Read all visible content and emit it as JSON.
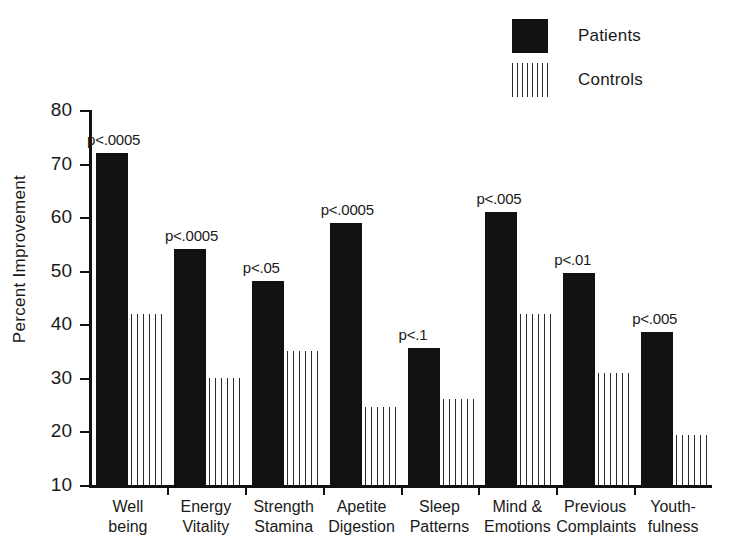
{
  "legend": {
    "items": [
      {
        "label": "Patients",
        "swatch": "solid-black-square",
        "color": "#111111"
      },
      {
        "label": "Controls",
        "swatch": "vertical-hatch-bars",
        "color": "#2b2b2b"
      }
    ]
  },
  "axes": {
    "ylabel": "Percent Improvement",
    "yticks": [
      "10",
      "20",
      "30",
      "40",
      "50",
      "60",
      "70",
      "80"
    ],
    "ymin": 10,
    "ymax": 80
  },
  "chart_data": {
    "type": "bar",
    "title": "",
    "xlabel": "",
    "ylabel": "Percent Improvement",
    "ylim": [
      10,
      80
    ],
    "grid": false,
    "legend_position": "top-right",
    "categories": [
      "Well being",
      "Energy Vitality",
      "Strength Stamina",
      "Apetite Digestion",
      "Sleep Patterns",
      "Mind & Emotions",
      "Previous Complaints",
      "Youth-fulness"
    ],
    "category_lines": [
      [
        "Well",
        "being"
      ],
      [
        "Energy",
        "Vitality"
      ],
      [
        "Strength",
        "Stamina"
      ],
      [
        "Apetite",
        "Digestion"
      ],
      [
        "Sleep",
        "Patterns"
      ],
      [
        "Mind &",
        "Emotions"
      ],
      [
        "Previous",
        "Complaints"
      ],
      [
        "Youth-",
        "fulness"
      ]
    ],
    "series": [
      {
        "name": "Patients",
        "values": [
          72,
          54,
          48,
          59,
          35.5,
          61,
          49.5,
          38.5
        ]
      },
      {
        "name": "Controls",
        "values": [
          42,
          30,
          35,
          24.5,
          26,
          42,
          31,
          19.3
        ]
      }
    ],
    "annotations": [
      "p<.0005",
      "p<.0005",
      "p<.05",
      "p<.0005",
      "p<.1",
      "p<.005",
      "p<.01",
      "p<.005"
    ]
  }
}
